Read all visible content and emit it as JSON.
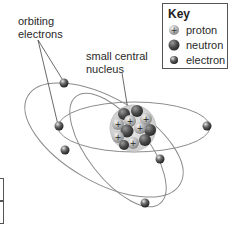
{
  "labels": {
    "orbiting_electrons": [
      "orbiting",
      "electrons"
    ],
    "small_central_nucleus": [
      "small central",
      "nucleus"
    ]
  },
  "key": {
    "title": "Key",
    "items": [
      {
        "label": "proton",
        "symbol": "+",
        "color": "#b8b8b8"
      },
      {
        "label": "neutron",
        "color": "#555555"
      },
      {
        "label": "electron",
        "color": "#4a4a4a"
      }
    ]
  },
  "diagram": {
    "nucleus": {
      "cx": 133,
      "cy": 128,
      "r": 22
    },
    "electron_count": 7
  }
}
